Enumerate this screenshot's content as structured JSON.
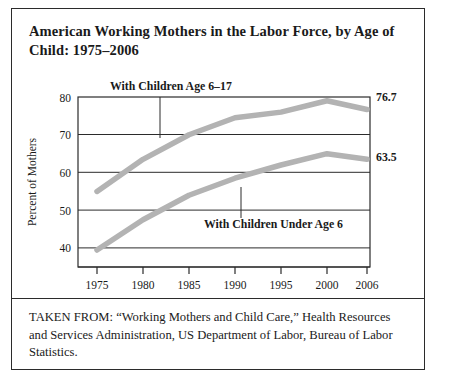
{
  "figure": {
    "title": "American Working Mothers in the Labor Force, by Age of Child: 1975–2006",
    "source_note": "TAKEN FROM: “Working Mothers and Child Care,” Health Resources and Services Administration, US Department of Labor, Bureau of Labor Statistics."
  },
  "chart_data": {
    "type": "line",
    "title": "American Working Mothers in the Labor Force, by Age of Child: 1975–2006",
    "xlabel": "",
    "ylabel": "Percent of Mothers",
    "x": [
      1975,
      1980,
      1985,
      1990,
      1995,
      2000,
      2006
    ],
    "tick_labels": [
      "1975",
      "1980",
      "1985",
      "1990",
      "1995",
      "2000",
      "2006"
    ],
    "ylim": [
      35,
      80
    ],
    "yticks": [
      40,
      50,
      60,
      70,
      80
    ],
    "ytick_labels": [
      "40",
      "50",
      "60",
      "70",
      "80"
    ],
    "grid": true,
    "legend_position": "inline-annotations",
    "series": [
      {
        "name": "With Children Age 6–17",
        "values": [
          55.0,
          63.5,
          70.0,
          74.5,
          76.0,
          79.0,
          76.7
        ],
        "end_label": "76.7",
        "color": "#b3b3b3"
      },
      {
        "name": "With Children Under Age 6",
        "values": [
          39.5,
          47.5,
          54.0,
          58.5,
          62.0,
          65.0,
          63.5
        ],
        "end_label": "63.5",
        "color": "#b3b3b3"
      }
    ],
    "annotations": [
      {
        "text": "With Children Age 6–17",
        "year": 1982
      },
      {
        "text": "With Children Under Age 6",
        "year": 1991
      }
    ]
  },
  "labels": {
    "y_axis_title": "Percent of Mothers",
    "series_upper": "With Children Age 6–17",
    "series_lower": "With Children Under Age 6",
    "end_upper": "76.7",
    "end_lower": "63.5",
    "y_80": "80",
    "y_70": "70",
    "y_60": "60",
    "y_50": "50",
    "y_40": "40",
    "x_1975": "1975",
    "x_1980": "1980",
    "x_1985": "1985",
    "x_1990": "1990",
    "x_1995": "1995",
    "x_2000": "2000",
    "x_2006": "2006"
  },
  "colors": {
    "line": "#b3b3b3",
    "axis": "#2b2b2b",
    "text": "#1a1a1a",
    "border": "#2b2b2b"
  }
}
